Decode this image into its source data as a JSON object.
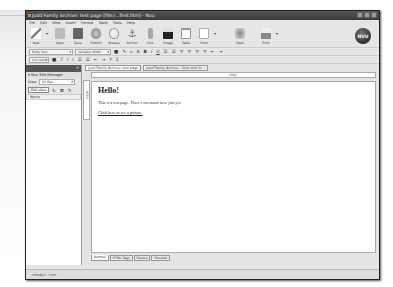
{
  "window": {
    "title": "Judd Family Archive: test page [file:/...first.htm] - Nvu",
    "controls": [
      "minimize",
      "maximize",
      "close"
    ]
  },
  "menu": [
    "File",
    "Edit",
    "View",
    "Insert",
    "Format",
    "Table",
    "Tools",
    "Help"
  ],
  "toolbar": [
    {
      "label": "New",
      "icon": "new-icon",
      "color": "#888"
    },
    {
      "label": "Open",
      "icon": "open-icon",
      "color": "#999"
    },
    {
      "label": "Save",
      "icon": "save-icon",
      "color": "#777"
    },
    {
      "label": "Publish",
      "icon": "publish-globe-icon",
      "color": "#8a8"
    },
    {
      "label": "Browse",
      "icon": "browse-magnifier-icon",
      "color": "#aaa"
    },
    {
      "label": "Anchor",
      "icon": "anchor-icon",
      "color": "#777"
    },
    {
      "label": "Link",
      "icon": "link-icon",
      "color": "#999"
    },
    {
      "label": "Image",
      "icon": "image-icon",
      "color": "#333"
    },
    {
      "label": "Table",
      "icon": "table-icon",
      "color": "#bbb"
    },
    {
      "label": "Form",
      "icon": "form-icon",
      "color": "#ccc"
    },
    {
      "label": "Spell",
      "icon": "spell-icon",
      "color": "#888"
    },
    {
      "label": "Print",
      "icon": "print-icon",
      "color": "#999"
    }
  ],
  "logo": "NVU",
  "format": {
    "paragraph_style": "Body Text",
    "font": "Variable Width",
    "class": "(no class)",
    "buttons": [
      "■",
      "✎",
      "A",
      "A",
      "B",
      "I",
      "U",
      "☰",
      "☰",
      "≡",
      "≡",
      "≡",
      "≡",
      "⇤",
      "⇥"
    ]
  },
  "sidebar": {
    "title": "Nvu Site Manager",
    "view_label": "View:",
    "view_value": "All files",
    "edit_sites": "Edit sites",
    "column": "Name"
  },
  "editor": {
    "tabs": [
      "Judd Family Archive: test page",
      "Judd Family Archive - Gran and Gr..."
    ],
    "address": "http:",
    "ruler_label": "BODY",
    "heading": "Hello!",
    "paragraph": "This is a test page.  There's not much here just yet.",
    "link": "Click here to see a picture."
  },
  "mode_tabs": [
    "Normal",
    "HTML Tags",
    "Source",
    "Preview"
  ],
  "status": "<body>  <a>"
}
